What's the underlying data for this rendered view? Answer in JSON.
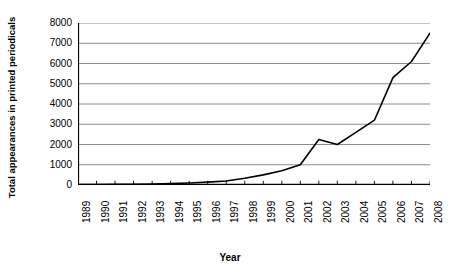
{
  "chart_data": {
    "type": "line",
    "title": "",
    "xlabel": "Year",
    "ylabel": "Total appearances in printed periodicals",
    "categories": [
      "1989",
      "1990",
      "1991",
      "1992",
      "1993",
      "1994",
      "1995",
      "1996",
      "1997",
      "1998",
      "1999",
      "2000",
      "2001",
      "2002",
      "2003",
      "2004",
      "2005",
      "2006",
      "2007",
      "2008"
    ],
    "values": [
      20,
      25,
      30,
      40,
      50,
      70,
      100,
      140,
      200,
      330,
      500,
      700,
      1000,
      2250,
      2000,
      2600,
      3200,
      5300,
      6100,
      7500
    ],
    "series": [
      {
        "name": "Total appearances in printed periodicals",
        "values": [
          20,
          25,
          30,
          40,
          50,
          70,
          100,
          140,
          200,
          330,
          500,
          700,
          1000,
          2250,
          2000,
          2600,
          3200,
          5300,
          6100,
          7500
        ]
      }
    ],
    "ylim": [
      0,
      8000
    ],
    "yticks": [
      0,
      1000,
      2000,
      3000,
      4000,
      5000,
      6000,
      7000,
      8000
    ],
    "ytick_labels": [
      "0",
      "1000",
      "2000",
      "3000",
      "4000",
      "5000",
      "6000",
      "7000",
      "8000"
    ],
    "xlim": [
      "1989",
      "2008"
    ],
    "grid": "horizontal",
    "legend": "none",
    "line_color": "#000000",
    "grid_color": "#808080",
    "axis_color": "#000000",
    "background_color": "#ffffff"
  },
  "axes": {
    "y_title": "Total appearances in printed periodicals",
    "x_title": "Year"
  }
}
